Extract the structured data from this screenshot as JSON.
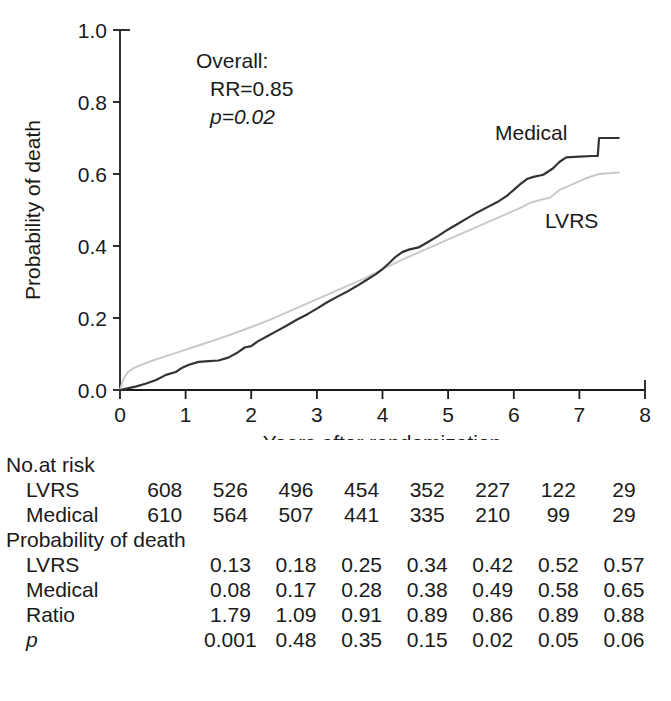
{
  "chart_data": {
    "type": "line",
    "title": "",
    "xlabel": "Years after randomization",
    "ylabel": "Probability of death",
    "xlim": [
      0,
      8
    ],
    "ylim": [
      0,
      1.0
    ],
    "xticks": [
      "0",
      "1",
      "2",
      "3",
      "4",
      "5",
      "6",
      "7",
      "8"
    ],
    "yticks": [
      "0.0",
      "0.2",
      "0.4",
      "0.6",
      "0.8",
      "1.0"
    ],
    "grid": false,
    "legend_position": "inline-curve-labels",
    "annotations": {
      "overall_label": "Overall:",
      "rr_label": "RR=0.85",
      "p_label": "p=0.02"
    },
    "series": [
      {
        "name": "Medical",
        "color": "#333333",
        "label_text": "Medical",
        "points": [
          [
            0.0,
            0.0
          ],
          [
            0.1,
            0.004
          ],
          [
            0.25,
            0.01
          ],
          [
            0.4,
            0.018
          ],
          [
            0.55,
            0.028
          ],
          [
            0.7,
            0.042
          ],
          [
            0.85,
            0.05
          ],
          [
            0.95,
            0.062
          ],
          [
            1.05,
            0.07
          ],
          [
            1.2,
            0.078
          ],
          [
            1.35,
            0.08
          ],
          [
            1.5,
            0.082
          ],
          [
            1.65,
            0.09
          ],
          [
            1.8,
            0.105
          ],
          [
            1.9,
            0.118
          ],
          [
            2.0,
            0.122
          ],
          [
            2.1,
            0.135
          ],
          [
            2.25,
            0.15
          ],
          [
            2.4,
            0.165
          ],
          [
            2.55,
            0.18
          ],
          [
            2.7,
            0.196
          ],
          [
            2.85,
            0.21
          ],
          [
            3.0,
            0.226
          ],
          [
            3.15,
            0.243
          ],
          [
            3.3,
            0.258
          ],
          [
            3.45,
            0.272
          ],
          [
            3.6,
            0.288
          ],
          [
            3.75,
            0.305
          ],
          [
            3.9,
            0.322
          ],
          [
            4.0,
            0.336
          ],
          [
            4.1,
            0.352
          ],
          [
            4.2,
            0.37
          ],
          [
            4.3,
            0.383
          ],
          [
            4.4,
            0.39
          ],
          [
            4.55,
            0.396
          ],
          [
            4.7,
            0.412
          ],
          [
            4.85,
            0.428
          ],
          [
            5.0,
            0.446
          ],
          [
            5.15,
            0.462
          ],
          [
            5.3,
            0.478
          ],
          [
            5.45,
            0.494
          ],
          [
            5.6,
            0.508
          ],
          [
            5.75,
            0.522
          ],
          [
            5.9,
            0.54
          ],
          [
            6.0,
            0.556
          ],
          [
            6.1,
            0.572
          ],
          [
            6.2,
            0.586
          ],
          [
            6.3,
            0.592
          ],
          [
            6.45,
            0.598
          ],
          [
            6.6,
            0.616
          ],
          [
            6.7,
            0.634
          ],
          [
            6.8,
            0.646
          ],
          [
            7.0,
            0.648
          ],
          [
            7.2,
            0.65
          ],
          [
            7.28,
            0.65
          ],
          [
            7.3,
            0.7
          ],
          [
            7.6,
            0.7
          ]
        ]
      },
      {
        "name": "LVRS",
        "color": "#c9c9c9",
        "label_text": "LVRS",
        "points": [
          [
            0.0,
            0.0
          ],
          [
            0.05,
            0.03
          ],
          [
            0.12,
            0.05
          ],
          [
            0.22,
            0.062
          ],
          [
            0.35,
            0.072
          ],
          [
            0.5,
            0.082
          ],
          [
            0.7,
            0.094
          ],
          [
            0.9,
            0.106
          ],
          [
            1.1,
            0.118
          ],
          [
            1.3,
            0.13
          ],
          [
            1.5,
            0.142
          ],
          [
            1.7,
            0.155
          ],
          [
            1.9,
            0.168
          ],
          [
            2.1,
            0.182
          ],
          [
            2.3,
            0.196
          ],
          [
            2.5,
            0.212
          ],
          [
            2.7,
            0.228
          ],
          [
            2.9,
            0.244
          ],
          [
            3.1,
            0.26
          ],
          [
            3.3,
            0.276
          ],
          [
            3.5,
            0.292
          ],
          [
            3.7,
            0.308
          ],
          [
            3.9,
            0.326
          ],
          [
            4.1,
            0.344
          ],
          [
            4.3,
            0.362
          ],
          [
            4.5,
            0.378
          ],
          [
            4.7,
            0.394
          ],
          [
            4.9,
            0.41
          ],
          [
            5.1,
            0.426
          ],
          [
            5.3,
            0.442
          ],
          [
            5.5,
            0.458
          ],
          [
            5.7,
            0.474
          ],
          [
            5.9,
            0.49
          ],
          [
            6.1,
            0.506
          ],
          [
            6.25,
            0.52
          ],
          [
            6.4,
            0.528
          ],
          [
            6.55,
            0.534
          ],
          [
            6.7,
            0.556
          ],
          [
            6.9,
            0.572
          ],
          [
            7.1,
            0.588
          ],
          [
            7.3,
            0.6
          ],
          [
            7.6,
            0.604
          ]
        ]
      }
    ]
  },
  "table": {
    "risk_section_title": "No.at risk",
    "prob_section_title": "Probability of death",
    "risk_rows": [
      {
        "label": "LVRS",
        "values": [
          "608",
          "526",
          "496",
          "454",
          "352",
          "227",
          "122",
          "29"
        ]
      },
      {
        "label": "Medical",
        "values": [
          "610",
          "564",
          "507",
          "441",
          "335",
          "210",
          "99",
          "29"
        ]
      }
    ],
    "prob_rows": [
      {
        "label": "LVRS",
        "italic": false,
        "values": [
          "0.13",
          "0.18",
          "0.25",
          "0.34",
          "0.42",
          "0.52",
          "0.57"
        ]
      },
      {
        "label": "Medical",
        "italic": false,
        "values": [
          "0.08",
          "0.17",
          "0.28",
          "0.38",
          "0.49",
          "0.58",
          "0.65"
        ]
      },
      {
        "label": "Ratio",
        "italic": false,
        "values": [
          "1.79",
          "1.09",
          "0.91",
          "0.89",
          "0.86",
          "0.89",
          "0.88"
        ]
      },
      {
        "label": "p",
        "italic": true,
        "values": [
          "0.001",
          "0.48",
          "0.35",
          "0.15",
          "0.02",
          "0.05",
          "0.06"
        ]
      }
    ]
  },
  "colors": {
    "medical": "#333333",
    "lvrs": "#c9c9c9",
    "axis": "#1a1a1a",
    "background": "#ffffff"
  }
}
